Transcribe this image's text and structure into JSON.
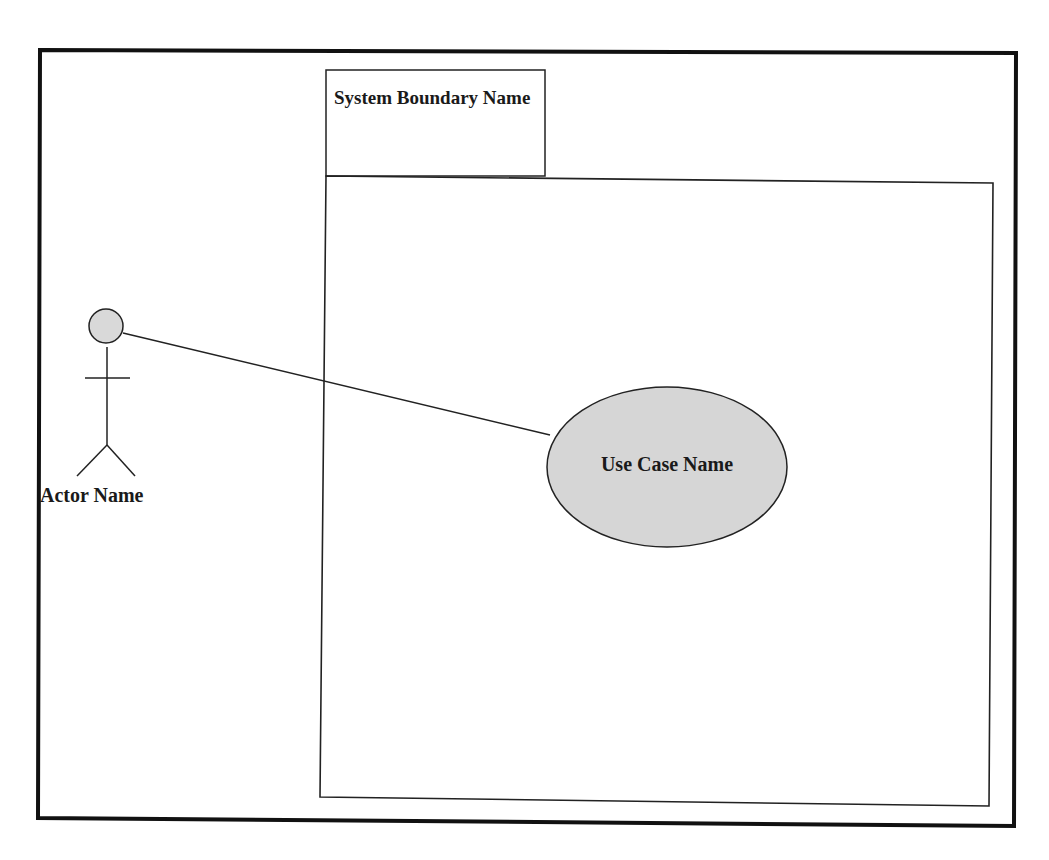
{
  "diagram": {
    "type": "uml-use-case",
    "frame": {
      "x": 40,
      "y": 50,
      "w": 976,
      "h": 776,
      "stroke": "#111111",
      "stroke_width": 4
    },
    "system_boundary": {
      "name": "System Boundary Name",
      "tab": {
        "x": 326,
        "y": 70,
        "w": 219,
        "h": 106
      },
      "box": {
        "x": 326,
        "y": 176,
        "w": 667,
        "h": 630
      },
      "stroke": "#222222"
    },
    "actor": {
      "name": "Actor Name",
      "head": {
        "cx": 106,
        "cy": 326,
        "r": 17,
        "fill": "#d9d9d9"
      },
      "stroke": "#222222"
    },
    "use_case": {
      "name": "Use Case Name",
      "ellipse": {
        "cx": 667,
        "cy": 467,
        "rx": 120,
        "ry": 80,
        "fill": "#d6d6d6"
      },
      "stroke": "#222222"
    },
    "associations": [
      {
        "from": "Actor Name",
        "to": "Use Case Name",
        "x1": 123,
        "y1": 333,
        "x2": 550,
        "y2": 435
      }
    ]
  }
}
